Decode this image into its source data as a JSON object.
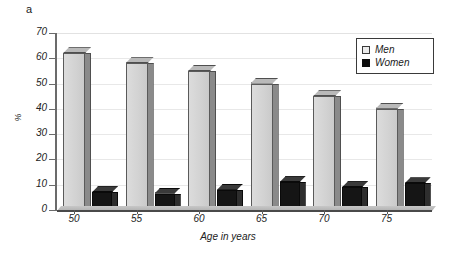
{
  "figure": {
    "panel_label": "a"
  },
  "chart_data": {
    "type": "bar",
    "title": "",
    "xlabel": "Age in years",
    "ylabel": "%",
    "categories": [
      "50",
      "55",
      "60",
      "65",
      "70",
      "75"
    ],
    "series": [
      {
        "name": "Men",
        "color": "#d4d4d4",
        "values": [
          62,
          58,
          55,
          50,
          45,
          40
        ]
      },
      {
        "name": "Women",
        "color": "#101010",
        "values": [
          7,
          6.5,
          8,
          11,
          9,
          10.5
        ]
      }
    ],
    "ylim": [
      0,
      70
    ],
    "yticks": [
      0,
      10,
      20,
      30,
      40,
      50,
      60,
      70
    ],
    "ytick_labels": [
      "0",
      "10",
      "20",
      "30",
      "40",
      "50",
      "60",
      "70"
    ],
    "grid": true,
    "grid_axis": "y",
    "legend_position": "upper right",
    "style": "3d-extruded-bars"
  },
  "legend": {
    "items": [
      {
        "label": "Men",
        "swatch": "light-square-swatch"
      },
      {
        "label": "Women",
        "swatch": "black-square-swatch"
      }
    ]
  },
  "axes": {
    "y_title": "%",
    "x_title": "Age in years",
    "y_tick_labels": [
      "70",
      "60",
      "50",
      "40",
      "30",
      "20",
      "10",
      "0"
    ],
    "x_tick_labels": [
      "50",
      "55",
      "60",
      "65",
      "70",
      "75"
    ]
  }
}
